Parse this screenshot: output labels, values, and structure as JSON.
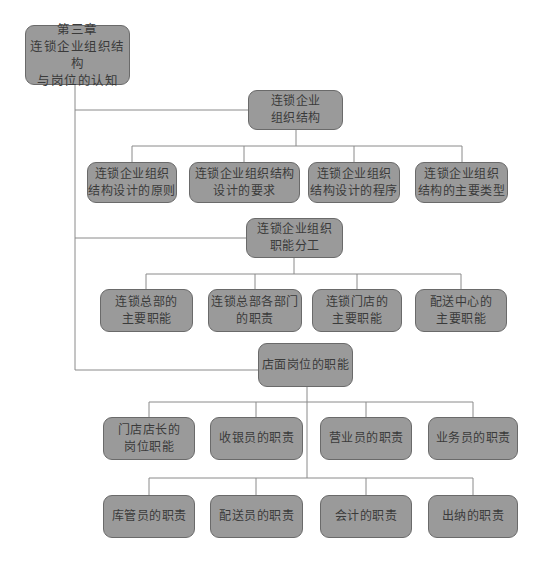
{
  "diagram": {
    "type": "org-chart",
    "colors": {
      "box_fill": "#9a9a9a",
      "box_border": "#6a6a6a",
      "line": "#8a8a8a",
      "text": "#3a3a3a",
      "background": "#ffffff"
    },
    "root": {
      "label": "第三章\n连锁企业组织结构\n与岗位的认知"
    },
    "sections": [
      {
        "label": "连锁企业\n组织结构",
        "children": [
          {
            "label": "连锁企业组织\n结构设计的原则"
          },
          {
            "label": "连锁企业组织结构\n设计的要求"
          },
          {
            "label": "连锁企业组织\n结构设计的程序"
          },
          {
            "label": "连锁企业组织\n结构的主要类型"
          }
        ]
      },
      {
        "label": "连锁企业组织\n职能分工",
        "children": [
          {
            "label": "连锁总部的\n主要职能"
          },
          {
            "label": "连锁总部各部门\n的职责"
          },
          {
            "label": "连锁门店的\n主要职能"
          },
          {
            "label": "配送中心的\n主要职能"
          }
        ]
      },
      {
        "label": "店面岗位的职能",
        "children": [
          {
            "label": "门店店长的\n岗位职能"
          },
          {
            "label": "收银员的职责"
          },
          {
            "label": "营业员的职责"
          },
          {
            "label": "业务员的职责"
          },
          {
            "label": "库管员的职责"
          },
          {
            "label": "配送员的职责"
          },
          {
            "label": "会计的职责"
          },
          {
            "label": "出纳的职责"
          }
        ]
      }
    ]
  }
}
